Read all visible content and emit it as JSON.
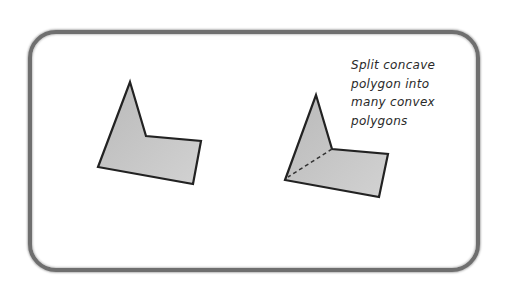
{
  "diagram": {
    "caption_lines": [
      "Split concave",
      "polygon into",
      "many convex",
      "polygons"
    ],
    "colors": {
      "frame": "#6f6f6f",
      "polygon_fill": "#c4c4c4",
      "polygon_stroke": "#222222",
      "text": "#2a2a2a"
    },
    "shapes": [
      {
        "name": "concave-polygon",
        "points": "130,82 146,136 201,141 193,184 98,167"
      },
      {
        "name": "split-polygon",
        "points": "316,95 332,149 388,154 379,197 285,180",
        "split_line": {
          "x1": 332,
          "y1": 149,
          "x2": 288,
          "y2": 177
        }
      }
    ]
  }
}
